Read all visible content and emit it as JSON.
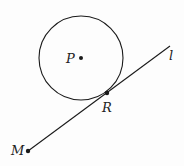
{
  "figure": {
    "circle": {
      "center_label": "P",
      "cx": 81,
      "cy": 58,
      "r": 42
    },
    "line": {
      "label": "l",
      "x1": 28,
      "y1": 151,
      "x2": 170,
      "y2": 46
    },
    "points": [
      {
        "label": "P",
        "x": 81,
        "y": 58
      },
      {
        "label": "R",
        "x": 107,
        "y": 93
      },
      {
        "label": "M",
        "x": 28,
        "y": 151
      }
    ],
    "labels": {
      "P": "P",
      "R": "R",
      "M": "M",
      "l": "l"
    },
    "stroke_color": "#1a1a1a"
  }
}
